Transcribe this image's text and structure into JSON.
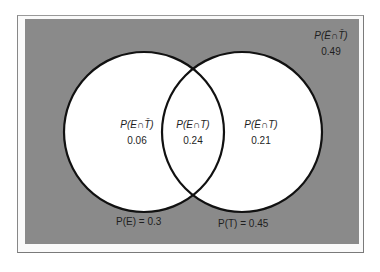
{
  "diagram": {
    "type": "venn",
    "colors": {
      "background": "#8a8a8a",
      "circle_fill": "#ffffff",
      "circle_stroke": "#111111",
      "text": "#1e1e1e"
    },
    "sets": [
      {
        "name": "E",
        "label": "P(E) = 0.3"
      },
      {
        "name": "T",
        "label": "P(T) = 0.45"
      }
    ],
    "regions": {
      "e_not_t": {
        "expr": "P(E∩T̄)",
        "value": "0.06"
      },
      "e_and_t": {
        "expr": "P(E∩T)",
        "value": "0.24"
      },
      "not_e_t": {
        "expr": "P(Ē∩T)",
        "value": "0.21"
      },
      "neither": {
        "expr": "P(Ē∩T̄)",
        "value": "0.49"
      }
    }
  }
}
